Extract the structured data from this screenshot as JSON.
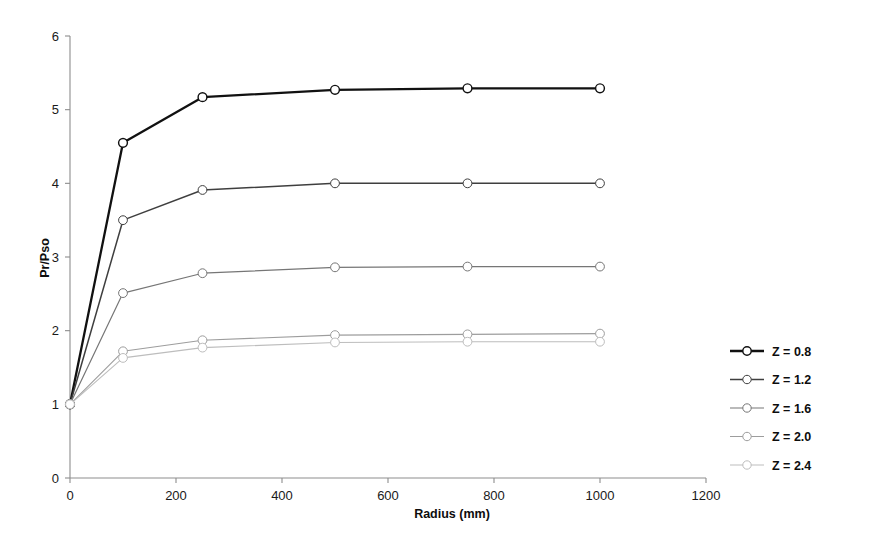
{
  "chart_data": {
    "type": "line",
    "title": "",
    "xlabel": "Radius (mm)",
    "ylabel": "Pr/Pso",
    "xlim": [
      0,
      1200
    ],
    "ylim": [
      0,
      6
    ],
    "xticks": [
      0,
      200,
      400,
      600,
      800,
      1000,
      1200
    ],
    "xtick_labels": [
      "0",
      "200",
      "400",
      "600",
      "800",
      "1000",
      "1200"
    ],
    "yticks": [
      0,
      1,
      2,
      3,
      4,
      5,
      6
    ],
    "ytick_labels": [
      "0",
      "1",
      "2",
      "3",
      "4",
      "5",
      "6"
    ],
    "grid": false,
    "legend_position": "right",
    "marker": "open-circle",
    "x": [
      0,
      100,
      250,
      500,
      750,
      1000
    ],
    "series": [
      {
        "name": "Z = 0.8",
        "color": "#111111",
        "line_width": 2.3,
        "values": [
          1.0,
          4.55,
          5.17,
          5.27,
          5.29,
          5.29
        ]
      },
      {
        "name": "Z = 1.2",
        "color": "#3f3f3f",
        "line_width": 1.5,
        "values": [
          1.0,
          3.5,
          3.91,
          4.0,
          4.0,
          4.0
        ]
      },
      {
        "name": "Z = 1.6",
        "color": "#767676",
        "line_width": 1.2,
        "values": [
          1.0,
          2.51,
          2.78,
          2.86,
          2.87,
          2.87
        ]
      },
      {
        "name": "Z = 2.0",
        "color": "#9d9d9d",
        "line_width": 1.1,
        "values": [
          1.0,
          1.72,
          1.87,
          1.94,
          1.95,
          1.96
        ]
      },
      {
        "name": "Z = 2.4",
        "color": "#bdbdbd",
        "line_width": 1.1,
        "values": [
          1.0,
          1.63,
          1.77,
          1.84,
          1.85,
          1.85
        ]
      }
    ]
  },
  "legend": {
    "entries": [
      {
        "label": "Z = 0.8"
      },
      {
        "label": "Z = 1.2"
      },
      {
        "label": "Z = 1.6"
      },
      {
        "label": "Z = 2.0"
      },
      {
        "label": "Z = 2.4"
      }
    ]
  },
  "axes": {
    "x_title": "Radius (mm)",
    "y_title": "Pr/Pso"
  }
}
